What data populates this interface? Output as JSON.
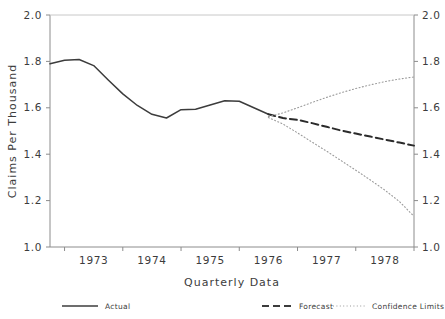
{
  "chart_data": {
    "type": "line",
    "title": "",
    "xlabel": "Quarterly Data",
    "ylabel": "Claims Per Thousand",
    "ylim": [
      1.0,
      2.0
    ],
    "y_ticks": [
      "1.0",
      "1.2",
      "1.4",
      "1.6",
      "1.8",
      "2.0"
    ],
    "y_tick_values": [
      1.0,
      1.2,
      1.4,
      1.6,
      1.8,
      2.0
    ],
    "right_axis": {
      "ylim": [
        1.0,
        2.0
      ],
      "ticks": [
        "1.0",
        "1.2",
        "1.4",
        "1.6",
        "1.8",
        "2.0"
      ]
    },
    "xlim": [
      1972.75,
      1979.0
    ],
    "x_tick_labels": [
      "1973",
      "1974",
      "1975",
      "1976",
      "1977",
      "1978"
    ],
    "x_tick_values": [
      1973.5,
      1974.5,
      1975.5,
      1976.5,
      1977.5,
      1978.5
    ],
    "x_tick_marks": [
      1973.0,
      1974.0,
      1975.0,
      1976.0,
      1977.0,
      1978.0,
      1979.0
    ],
    "grid": false,
    "legend_position": "below",
    "series": [
      {
        "name": "Actual",
        "style": "solid",
        "color": "#3c3c3c",
        "x": [
          1972.75,
          1973.0,
          1973.25,
          1973.5,
          1973.75,
          1974.0,
          1974.25,
          1974.5,
          1974.75,
          1975.0,
          1975.25,
          1975.5,
          1975.75,
          1976.0,
          1976.25,
          1976.5
        ],
        "values": [
          1.79,
          1.805,
          1.808,
          1.782,
          1.72,
          1.66,
          1.61,
          1.572,
          1.556,
          1.592,
          1.594,
          1.612,
          1.63,
          1.628,
          1.6,
          1.572
        ]
      },
      {
        "name": "Forecast",
        "style": "dashed",
        "color": "#2b2b2b",
        "x": [
          1976.5,
          1976.75,
          1977.0,
          1977.25,
          1977.5,
          1977.75,
          1978.0,
          1978.25,
          1978.5,
          1978.75,
          1979.0
        ],
        "values": [
          1.572,
          1.556,
          1.548,
          1.534,
          1.518,
          1.502,
          1.489,
          1.476,
          1.463,
          1.45,
          1.437
        ]
      },
      {
        "name": "Confidence Limits",
        "style": "dotted",
        "color": "#9a9a9a",
        "bound": "upper",
        "x": [
          1976.5,
          1976.75,
          1977.0,
          1977.25,
          1977.5,
          1977.75,
          1978.0,
          1978.25,
          1978.5,
          1978.75,
          1979.0
        ],
        "values": [
          1.562,
          1.578,
          1.6,
          1.623,
          1.645,
          1.665,
          1.683,
          1.699,
          1.713,
          1.724,
          1.733
        ]
      },
      {
        "name": "Confidence Limits",
        "style": "dotted",
        "color": "#9a9a9a",
        "bound": "lower",
        "x": [
          1976.5,
          1976.75,
          1977.0,
          1977.25,
          1977.5,
          1977.75,
          1978.0,
          1978.25,
          1978.5,
          1978.75,
          1979.0
        ],
        "values": [
          1.558,
          1.53,
          1.492,
          1.452,
          1.413,
          1.372,
          1.331,
          1.289,
          1.245,
          1.196,
          1.132
        ]
      }
    ],
    "legend": [
      {
        "label": "Actual",
        "style": "solid"
      },
      {
        "label": "Forecast",
        "style": "dashed"
      },
      {
        "label": "Confidence Limits",
        "style": "dotted"
      }
    ]
  }
}
